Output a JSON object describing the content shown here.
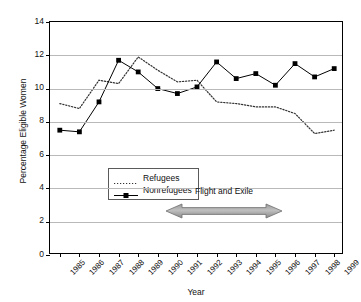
{
  "chart_data": {
    "type": "line",
    "title": "",
    "xlabel": "Year",
    "ylabel": "Percentage Eligible Women",
    "categories": [
      "1985",
      "1986",
      "1987",
      "1988",
      "1989",
      "1990",
      "1991",
      "1992",
      "1993",
      "1994",
      "1995",
      "1996",
      "1997",
      "1998",
      "1999"
    ],
    "ylim": [
      0,
      14
    ],
    "ytick_step": 2,
    "yticks": [
      "0",
      "2",
      "4",
      "6",
      "8",
      "10",
      "12",
      "14"
    ],
    "grid": "horizontal",
    "legend_position": "inside-left",
    "series": [
      {
        "name": "Refugees",
        "style": "dotted",
        "marker": "none",
        "color": "#333333",
        "values": [
          9.1,
          8.8,
          10.5,
          10.3,
          11.9,
          11.1,
          10.4,
          10.5,
          9.2,
          9.1,
          8.9,
          8.9,
          8.5,
          7.3,
          7.5
        ]
      },
      {
        "name": "Nonrefugees",
        "style": "solid",
        "marker": "square",
        "color": "#000000",
        "values": [
          7.5,
          7.4,
          9.2,
          11.7,
          11.0,
          10.0,
          9.7,
          10.1,
          11.6,
          10.6,
          10.9,
          10.2,
          11.5,
          10.7,
          11.2
        ]
      }
    ],
    "annotations": [
      {
        "text": "Flight and Exile",
        "type": "double-arrow",
        "x_start": "1991",
        "x_end": "1996",
        "y": 2.5
      }
    ]
  },
  "legend": {
    "items": [
      {
        "label": "Refugees"
      },
      {
        "label": "Nonrefugees"
      }
    ]
  },
  "annotation": {
    "label": "Flight and Exile"
  },
  "axes": {
    "y_title": "Percentage Eligible Women",
    "x_title": "Year"
  }
}
